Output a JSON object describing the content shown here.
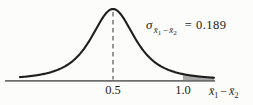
{
  "chart_data": {
    "type": "line",
    "subtype": "normal-distribution-curve",
    "mean": 0.5,
    "std_error": 0.189,
    "x_ticks": [
      "0.5",
      "1.0"
    ],
    "x_tick_values": [
      0.5,
      1.0
    ],
    "xlabel": "x̄₁ − x̄₂",
    "annotation": "σx̄₁−x̄₂ = 0.189",
    "dashed_line_at": 0.5,
    "shaded_region": {
      "from": 1.0,
      "side": "right-tail"
    },
    "grid": false,
    "legend": false
  },
  "labels": {
    "sigma": "σ",
    "equals": "=",
    "value": "0.189"
  },
  "math": {
    "xbar": "x̄",
    "sub1": "1",
    "minus": "−",
    "sub2": "2"
  },
  "colors": {
    "background": "#fcfcfa",
    "curve": "#1e1e1e",
    "axis": "#6e6e6e",
    "shade": "#a8a8a8",
    "dashed_line": "#565656",
    "text": "#1b1b1b"
  }
}
